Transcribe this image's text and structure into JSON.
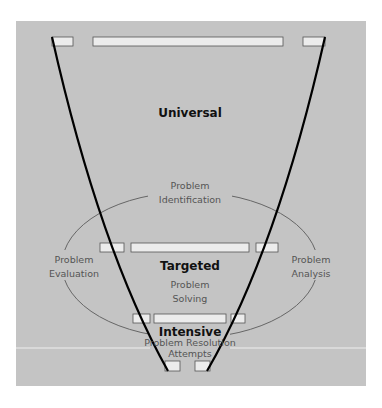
{
  "colors": {
    "background": "#ffffff",
    "panel": "#c4c4c4",
    "box_fill": "#ececec",
    "box_stroke": "#555555",
    "funnel_stroke": "#000000",
    "cycle_stroke": "#666666",
    "divider": "#eeeeee"
  },
  "tiers": {
    "universal": "Universal",
    "targeted": "Targeted",
    "intensive": "Intensive"
  },
  "cycle": {
    "identification": [
      "Problem",
      "Identification"
    ],
    "analysis": [
      "Problem",
      "Analysis"
    ],
    "evaluation": [
      "Problem",
      "Evaluation"
    ],
    "solving": [
      "Problem",
      "Solving"
    ],
    "resolution": [
      "Problem Resolution",
      "Attempts"
    ]
  }
}
